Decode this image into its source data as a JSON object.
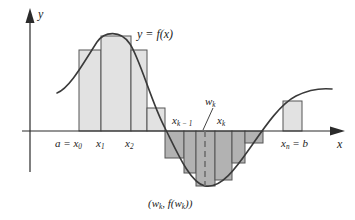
{
  "figure": {
    "axes": {
      "y_label": "y",
      "x_label": "x",
      "baseline_y": 131,
      "origin_x": 30
    },
    "curve_label": "y = f(x)",
    "point_label": "(w",
    "labels": {
      "a_eq": "a = x",
      "a_sub": "0",
      "x1": "x",
      "x1_sub": "1",
      "x2": "x",
      "x2_sub": "2",
      "xk_minus_1": "x",
      "xk_minus_1_sub": "k − 1",
      "xk": "x",
      "xk_sub": "k",
      "wk": "w",
      "wk_sub": "k",
      "xn_eq": "x",
      "xn_sub": "n",
      "xn_eq_b": " = b",
      "point_open": "(w",
      "point_sub1": "k",
      "point_mid": ", f(w",
      "point_sub2": "k",
      "point_close": "))"
    },
    "colors": {
      "bar_light": "#e2e2e2",
      "bar_dark": "#b2b2b2",
      "stroke": "#555555",
      "curve": "#3a3a3a",
      "axis": "#2b2b2b",
      "text": "#222222",
      "background": "#ffffff"
    },
    "bars_above": [
      {
        "x0": 79,
        "x1": 101,
        "top": 50
      },
      {
        "x0": 101,
        "x1": 131,
        "top": 36
      },
      {
        "x0": 131,
        "x1": 147,
        "top": 50
      },
      {
        "x0": 147,
        "x1": 165,
        "top": 108
      }
    ],
    "bars_below": [
      {
        "x0": 165,
        "x1": 184,
        "bottom": 158
      },
      {
        "x0": 184,
        "x1": 196,
        "bottom": 173
      },
      {
        "x0": 196,
        "x1": 215,
        "bottom": 186
      },
      {
        "x0": 215,
        "x1": 232,
        "bottom": 180
      },
      {
        "x0": 232,
        "x1": 245,
        "bottom": 163
      },
      {
        "x0": 245,
        "x1": 263,
        "bottom": 143
      }
    ],
    "bars_right": [
      {
        "x0": 283,
        "x1": 302,
        "top": 101
      }
    ],
    "wk_line": {
      "x": 205,
      "y_top": 131,
      "y_bottom": 186
    },
    "curve_peak": {
      "x": 112,
      "y": 32
    },
    "curve_trough": {
      "x": 205,
      "y": 186
    }
  }
}
